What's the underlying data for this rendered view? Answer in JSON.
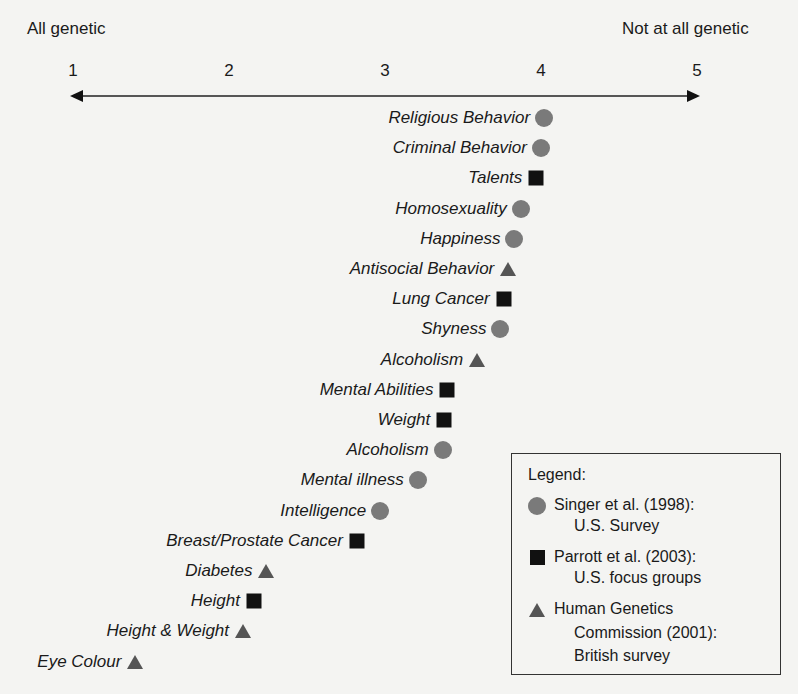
{
  "chart_data": {
    "type": "scatter",
    "title": "",
    "xlabel": "",
    "ylabel": "",
    "axis": {
      "left_label": "All genetic",
      "right_label": "Not at all genetic",
      "ticks": [
        "1",
        "2",
        "3",
        "4",
        "5"
      ],
      "xlim": [
        1,
        5
      ],
      "grid": false
    },
    "legend": {
      "title": "Legend:",
      "position": "bottom-right",
      "entries": [
        {
          "marker": "circle",
          "color": "#7a7a7a",
          "line1": "Singer et al. (1998):",
          "line2": "U.S. Survey"
        },
        {
          "marker": "square",
          "color": "#111111",
          "line1": "Parrott et al. (2003):",
          "line2": "U.S. focus groups"
        },
        {
          "marker": "triangle",
          "color": "#555555",
          "line1": "Human Genetics",
          "line2": "Commission (2001):",
          "line3": "British survey"
        }
      ]
    },
    "series": [
      {
        "name": "Singer et al. (1998): U.S. Survey",
        "marker": "circle",
        "points": [
          {
            "label": "Religious Behavior",
            "x": 4.02
          },
          {
            "label": "Criminal Behavior",
            "x": 4.0
          },
          {
            "label": "Homosexuality",
            "x": 3.87
          },
          {
            "label": "Happiness",
            "x": 3.83
          },
          {
            "label": "Shyness",
            "x": 3.74
          },
          {
            "label": "Alcoholism",
            "x": 3.37
          },
          {
            "label": "Mental illness",
            "x": 3.21
          },
          {
            "label": "Intelligence",
            "x": 2.97
          }
        ]
      },
      {
        "name": "Parrott et al. (2003): U.S. focus groups",
        "marker": "square",
        "points": [
          {
            "label": "Talents",
            "x": 3.97
          },
          {
            "label": "Lung Cancer",
            "x": 3.76
          },
          {
            "label": "Mental Abilities",
            "x": 3.4
          },
          {
            "label": "Weight",
            "x": 3.38
          },
          {
            "label": "Breast/Prostate Cancer",
            "x": 2.82
          },
          {
            "label": "Height",
            "x": 2.16
          }
        ]
      },
      {
        "name": "Human Genetics Commission (2001): British survey",
        "marker": "triangle",
        "points": [
          {
            "label": "Antisocial Behavior",
            "x": 3.79
          },
          {
            "label": "Alcoholism",
            "x": 3.59
          },
          {
            "label": "Diabetes",
            "x": 2.24
          },
          {
            "label": "Height & Weight",
            "x": 2.09
          },
          {
            "label": "Eye Colour",
            "x": 1.4
          }
        ]
      }
    ],
    "rows": [
      {
        "label": "Religious Behavior",
        "x": 4.02,
        "marker": "circle"
      },
      {
        "label": "Criminal Behavior",
        "x": 4.0,
        "marker": "circle"
      },
      {
        "label": "Talents",
        "x": 3.97,
        "marker": "square"
      },
      {
        "label": "Homosexuality",
        "x": 3.87,
        "marker": "circle"
      },
      {
        "label": "Happiness",
        "x": 3.83,
        "marker": "circle"
      },
      {
        "label": "Antisocial Behavior",
        "x": 3.79,
        "marker": "triangle"
      },
      {
        "label": "Lung Cancer",
        "x": 3.76,
        "marker": "square"
      },
      {
        "label": "Shyness",
        "x": 3.74,
        "marker": "circle"
      },
      {
        "label": "Alcoholism",
        "x": 3.59,
        "marker": "triangle"
      },
      {
        "label": "Mental Abilities",
        "x": 3.4,
        "marker": "square"
      },
      {
        "label": "Weight",
        "x": 3.38,
        "marker": "square"
      },
      {
        "label": "Alcoholism",
        "x": 3.37,
        "marker": "circle"
      },
      {
        "label": "Mental illness",
        "x": 3.21,
        "marker": "circle"
      },
      {
        "label": "Intelligence",
        "x": 2.97,
        "marker": "circle"
      },
      {
        "label": "Breast/Prostate Cancer",
        "x": 2.82,
        "marker": "square"
      },
      {
        "label": "Diabetes",
        "x": 2.24,
        "marker": "triangle"
      },
      {
        "label": "Height",
        "x": 2.16,
        "marker": "square"
      },
      {
        "label": "Height & Weight",
        "x": 2.09,
        "marker": "triangle"
      },
      {
        "label": "Eye Colour",
        "x": 1.4,
        "marker": "triangle"
      }
    ]
  }
}
